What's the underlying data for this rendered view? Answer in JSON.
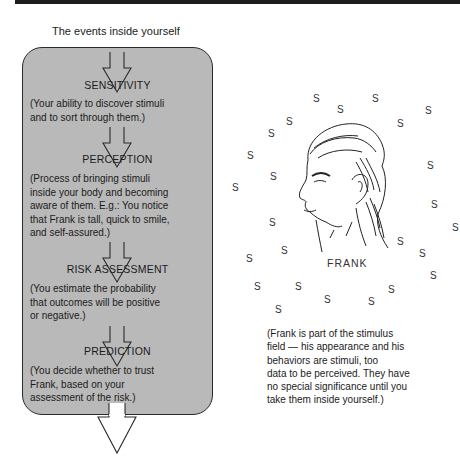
{
  "heading": "The events inside yourself",
  "stages": [
    {
      "label": "SENSITIVITY",
      "description": "(Your ability to discover stimuli\nand to sort through them.)"
    },
    {
      "label": "PERCEPTION",
      "description": "(Process of bringing stimuli\ninside your body and becoming\naware of them.  E.g.:  You notice\nthat Frank is tall, quick to smile,\nand self-assured.)"
    },
    {
      "label": "RISK ASSESSMENT",
      "description": "(You estimate the probability\nthat outcomes will be positive\nor negative.)"
    },
    {
      "label": "PREDICTION",
      "description": "(You decide whether to trust\nFrank, based on your\nassessment of the risk.)"
    }
  ],
  "figure": {
    "name_label": "FRANK",
    "stimulus_symbol": "S",
    "caption": "(Frank is part of the stimulus\nfield — his appearance and his\nbehaviors are stimuli, too\ndata to be perceived.  They have\nno special significance until you\ntake them inside yourself.)"
  },
  "colors": {
    "box_fill": "#b9b9b9",
    "line": "#2a2a2a"
  }
}
